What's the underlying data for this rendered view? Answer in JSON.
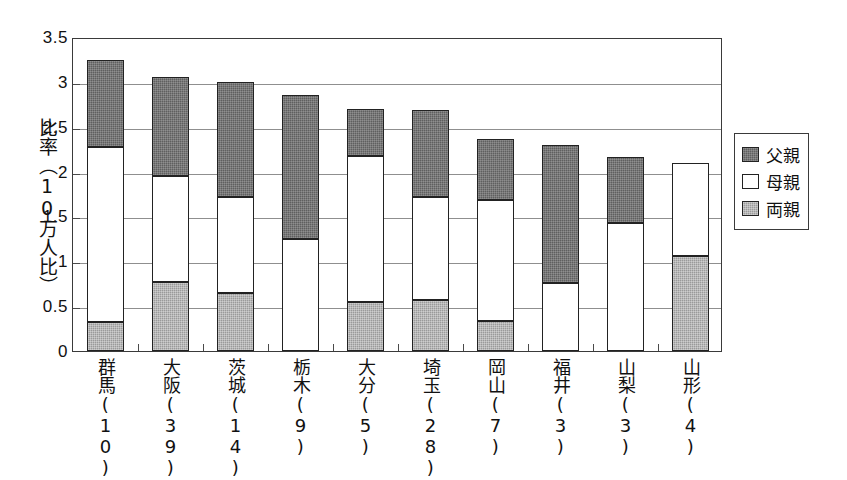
{
  "chart_data": {
    "type": "bar",
    "stacked": true,
    "title": "",
    "subtitle": "",
    "xlabel": "",
    "ylabel": "比率（10万人比）",
    "ylim": [
      0,
      3.5
    ],
    "ytick_step": 0.5,
    "ytick_labels": [
      "0",
      "0.5",
      "1",
      "1.5",
      "2",
      "2.5",
      "3",
      "3.5"
    ],
    "ytick_values": [
      0,
      0.5,
      1,
      1.5,
      2,
      2.5,
      3,
      3.5
    ],
    "grid": true,
    "legend_position": "right",
    "categories": [
      "群馬\n(10)",
      "大阪\n(39)",
      "茨城\n(14)",
      "栃木\n(9)",
      "大分\n(5)",
      "埼玉\n(28)",
      "岡山\n(7)",
      "福井\n(3)",
      "山梨\n(3)",
      "山形\n(4)"
    ],
    "category_names": [
      "群馬",
      "大阪",
      "茨城",
      "栃木",
      "大分",
      "埼玉",
      "岡山",
      "福井",
      "山梨",
      "山形"
    ],
    "category_counts": [
      "(10)",
      "(39)",
      "(14)",
      "(9)",
      "(5)",
      "(28)",
      "(7)",
      "(3)",
      "(3)",
      "(4)"
    ],
    "series": [
      {
        "name": "両親",
        "color": "#9a9a9a",
        "values": [
          0.32,
          0.77,
          0.65,
          0.0,
          0.55,
          0.57,
          0.34,
          0.0,
          0.0,
          1.06
        ]
      },
      {
        "name": "母親",
        "color": "#ffffff",
        "values": [
          1.95,
          1.18,
          1.07,
          1.25,
          1.62,
          1.15,
          1.34,
          0.76,
          1.43,
          1.04
        ]
      },
      {
        "name": "父親",
        "color": "#5f5f5f",
        "values": [
          0.97,
          1.1,
          1.28,
          1.6,
          0.53,
          0.97,
          0.68,
          1.54,
          0.73,
          0.0
        ]
      }
    ],
    "stack_order_bottom_to_top": [
      "両親",
      "母親",
      "父親"
    ],
    "totals": [
      3.24,
      3.05,
      3.0,
      2.85,
      2.7,
      2.69,
      2.36,
      2.3,
      2.16,
      2.1
    ]
  },
  "legend": {
    "items": [
      {
        "label": "父親",
        "swatch": "father-swatch"
      },
      {
        "label": "母親",
        "swatch": "mother-swatch"
      },
      {
        "label": "両親",
        "swatch": "both-parents-swatch"
      }
    ]
  },
  "colors": {
    "father": "#5f5f5f",
    "mother": "#ffffff",
    "both": "#9a9a9a",
    "axis": "#3a3a3a",
    "grid": "#8f8f8f",
    "text": "#111111",
    "background": "#ffffff"
  }
}
